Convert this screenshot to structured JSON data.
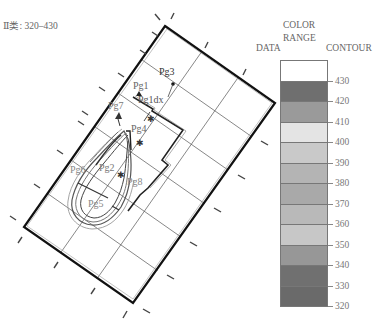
{
  "title": "Ⅱ类: 320–430",
  "legend": {
    "header_data": "DATA",
    "header_color": "COLOR",
    "header_range": "RANGE",
    "header_contour": "CONTOUR",
    "bands": [
      {
        "from": 430,
        "to": null,
        "color": "#ffffff"
      },
      {
        "from": 420,
        "to": 430,
        "color": "#6f6f6f"
      },
      {
        "from": 410,
        "to": 420,
        "color": "#9a9a9a"
      },
      {
        "from": 400,
        "to": 410,
        "color": "#e4e4e4"
      },
      {
        "from": 390,
        "to": 400,
        "color": "#c9c9c9"
      },
      {
        "from": 380,
        "to": 390,
        "color": "#b4b4b4"
      },
      {
        "from": 370,
        "to": 380,
        "color": "#a9a9a9"
      },
      {
        "from": 360,
        "to": 370,
        "color": "#b9b9b9"
      },
      {
        "from": 350,
        "to": 360,
        "color": "#c7c7c7"
      },
      {
        "from": 340,
        "to": 350,
        "color": "#979797"
      },
      {
        "from": 330,
        "to": 340,
        "color": "#707070"
      },
      {
        "from": 320,
        "to": 330,
        "color": "#6a6a6a"
      }
    ],
    "tick_labels": [
      "430",
      "420",
      "410",
      "400",
      "390",
      "380",
      "370",
      "360",
      "350",
      "340",
      "330",
      "320"
    ]
  },
  "wells": [
    {
      "label": "Pg3",
      "x": 162,
      "y": 76
    },
    {
      "label": "Pg1",
      "x": 133,
      "y": 88
    },
    {
      "label": "Pg1dx",
      "x": 141,
      "y": 101
    },
    {
      "label": "Pg7",
      "x": 110,
      "y": 108
    },
    {
      "label": "Pg4",
      "x": 131,
      "y": 131
    },
    {
      "label": "Pg6",
      "x": 73,
      "y": 171
    },
    {
      "label": "Pg2",
      "x": 101,
      "y": 170
    },
    {
      "label": "Pg8",
      "x": 128,
      "y": 183
    },
    {
      "label": "Pg5",
      "x": 89,
      "y": 205
    }
  ]
}
